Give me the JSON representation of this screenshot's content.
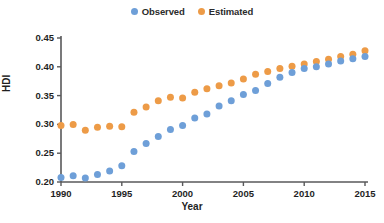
{
  "chart_data": {
    "type": "scatter",
    "title": "",
    "xlabel": "Year",
    "ylabel": "HDI",
    "xlim": [
      1990,
      2015
    ],
    "ylim": [
      0.2,
      0.45
    ],
    "xticks": [
      "1990",
      "1995",
      "2000",
      "2005",
      "2010",
      "2015"
    ],
    "yticks": [
      "0.20",
      "0.25",
      "0.30",
      "0.35",
      "0.40",
      "0.45"
    ],
    "grid": false,
    "legend_position": "top-center",
    "x": [
      1990,
      1991,
      1992,
      1993,
      1994,
      1995,
      1996,
      1997,
      1998,
      1999,
      2000,
      2001,
      2002,
      2003,
      2004,
      2005,
      2006,
      2007,
      2008,
      2009,
      2010,
      2011,
      2012,
      2013,
      2014,
      2015
    ],
    "series": [
      {
        "name": "Observed",
        "color": "#6e9fd8",
        "values": [
          0.208,
          0.211,
          0.207,
          0.213,
          0.219,
          0.228,
          0.253,
          0.267,
          0.279,
          0.291,
          0.298,
          0.311,
          0.318,
          0.332,
          0.341,
          0.352,
          0.359,
          0.371,
          0.382,
          0.39,
          0.397,
          0.4,
          0.405,
          0.41,
          0.414,
          0.418
        ]
      },
      {
        "name": "Estimated",
        "color": "#ed9b47",
        "values": [
          0.298,
          0.3,
          0.29,
          0.295,
          0.297,
          0.296,
          0.321,
          0.33,
          0.341,
          0.347,
          0.346,
          0.356,
          0.362,
          0.367,
          0.372,
          0.379,
          0.387,
          0.392,
          0.397,
          0.401,
          0.405,
          0.409,
          0.413,
          0.418,
          0.422,
          0.428
        ]
      }
    ]
  },
  "legend": {
    "entries": [
      {
        "label": "Observed"
      },
      {
        "label": "Estimated"
      }
    ]
  },
  "axes": {
    "x_title": "Year",
    "y_title": "HDI"
  },
  "colors": {
    "observed": "#6e9fd8",
    "estimated": "#ed9b47",
    "axis": "#58585a",
    "text": "#1f1f1f"
  }
}
